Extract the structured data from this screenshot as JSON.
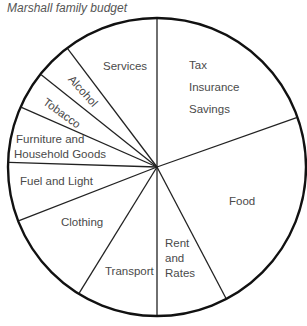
{
  "chart_data": {
    "type": "pie",
    "title": "Marshall family budget",
    "start_angle": "top (12 o'clock), clockwise",
    "legend": "none (labels inside slices)",
    "slices": [
      {
        "label": "Tax Insurance Savings",
        "lines": [
          "Tax",
          "Insurance",
          "Savings"
        ],
        "value": 19.6
      },
      {
        "label": "Food",
        "lines": [
          "Food"
        ],
        "value": 22.7
      },
      {
        "label": "Rent and Rates",
        "lines": [
          "Rent",
          "and",
          "Rates"
        ],
        "value": 7.7
      },
      {
        "label": "Transport",
        "lines": [
          "Transport"
        ],
        "value": 8.8
      },
      {
        "label": "Clothing",
        "lines": [
          "Clothing"
        ],
        "value": 10.3
      },
      {
        "label": "Fuel and Light",
        "lines": [
          "Fuel and Light"
        ],
        "value": 6.4
      },
      {
        "label": "Furniture and Household Goods",
        "lines": [
          "Furniture and",
          "Household Goods"
        ],
        "value": 6.1
      },
      {
        "label": "Tobacco",
        "lines": [
          "Tobacco"
        ],
        "value": 4.1
      },
      {
        "label": "Alcohol",
        "lines": [
          "Alcohol"
        ],
        "value": 4.0
      },
      {
        "label": "Services",
        "lines": [
          "Services"
        ],
        "value": 10.3
      }
    ],
    "units": "percent of budget (estimated from slice angles)"
  },
  "colors": {
    "outline": "#111111",
    "divider": "#222222",
    "text": "#4a4a4a",
    "title": "#555555",
    "background": "#ffffff"
  }
}
